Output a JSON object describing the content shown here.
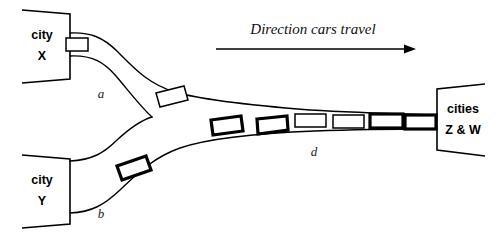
{
  "figure": {
    "background_color": "#ffffff",
    "stroke_color": "#000000"
  },
  "annotation": {
    "direction_label": "Direction cars travel",
    "arrow_icon": "right-arrow-icon"
  },
  "cities": [
    {
      "id": "city-x",
      "line1": "city",
      "line2": "X",
      "position": "top-left"
    },
    {
      "id": "city-y",
      "line1": "city",
      "line2": "Y",
      "position": "bottom-left"
    },
    {
      "id": "cities-zw",
      "line1": "cities",
      "line2": "Z & W",
      "position": "right"
    }
  ],
  "roads": [
    {
      "id": "road-a",
      "label": "a",
      "from": "city X",
      "to": "merge junction"
    },
    {
      "id": "road-b",
      "label": "b",
      "from": "city Y",
      "to": "merge junction"
    },
    {
      "id": "road-d",
      "label": "d",
      "from": "merge junction",
      "to": "cities Z & W"
    }
  ],
  "cars": [
    {
      "id": "car-city-x-exit",
      "road": "a",
      "style": "thin",
      "note": "at city X exit"
    },
    {
      "id": "car-a-1",
      "road": "a",
      "style": "thin",
      "note": "on road a"
    },
    {
      "id": "car-b-1",
      "road": "b",
      "style": "bold",
      "note": "on road b"
    },
    {
      "id": "car-d-1",
      "road": "d",
      "style": "bold",
      "note": "on road d"
    },
    {
      "id": "car-d-2",
      "road": "d",
      "style": "bold",
      "note": "on road d"
    },
    {
      "id": "car-d-3",
      "road": "d",
      "style": "thin",
      "note": "on road d"
    },
    {
      "id": "car-d-4",
      "road": "d",
      "style": "thin",
      "note": "on road d"
    },
    {
      "id": "car-d-5",
      "road": "d",
      "style": "bold",
      "note": "on road d"
    },
    {
      "id": "car-d-6",
      "road": "d",
      "style": "bold",
      "note": "on road d"
    }
  ]
}
